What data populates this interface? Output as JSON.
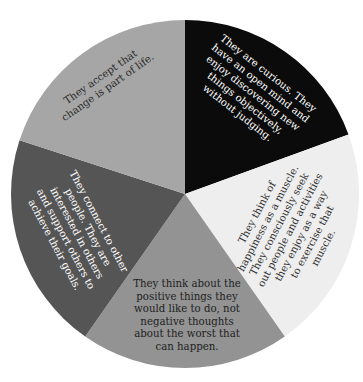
{
  "chart_data": {
    "type": "pie",
    "title": "",
    "center": [
      185,
      194
    ],
    "radius": 174,
    "slices": [
      {
        "id": "curious",
        "start_deg": 0,
        "end_deg": 70,
        "color": "#0b0b0b",
        "text_color": "#ffffff",
        "lines": [
          "They are curious. They",
          "have an open mind and",
          "enjoy discovering new",
          "things objectively,",
          "without judging."
        ],
        "label_pos": [
          253,
          93
        ],
        "label_rotate": 38
      },
      {
        "id": "happiness-muscle",
        "start_deg": 70,
        "end_deg": 145,
        "color": "#eeeeee",
        "text_color": "#333333",
        "lines": [
          "They think of",
          "happiness as a muscle.",
          "They consciously seek",
          "out people and activities",
          "they enjoy as a way",
          "to exercise that",
          "muscle."
        ],
        "label_pos": [
          290,
          230
        ],
        "label_rotate": -62
      },
      {
        "id": "positive-things",
        "start_deg": 145,
        "end_deg": 215,
        "color": "#939393",
        "text_color": "#1e1e1e",
        "lines": [
          "They think about the",
          "positive things they",
          "would like to do, not",
          "negative thoughts",
          "about the worst that",
          "can happen."
        ],
        "label_pos": [
          187,
          315
        ],
        "label_rotate": 0
      },
      {
        "id": "connect-others",
        "start_deg": 215,
        "end_deg": 288,
        "color": "#555555",
        "text_color": "#ffffff",
        "lines": [
          "They connect to other",
          "people. They are",
          "interested in others",
          "and support others to",
          "achieve their goals."
        ],
        "label_pos": [
          77,
          233
        ],
        "label_rotate": 62
      },
      {
        "id": "accept-change",
        "start_deg": 288,
        "end_deg": 360,
        "color": "#a6a6a6",
        "text_color": "#2a2a2a",
        "lines": [
          "They accept that",
          "change is part of life."
        ],
        "label_pos": [
          104,
          82
        ],
        "label_rotate": -35
      }
    ]
  }
}
